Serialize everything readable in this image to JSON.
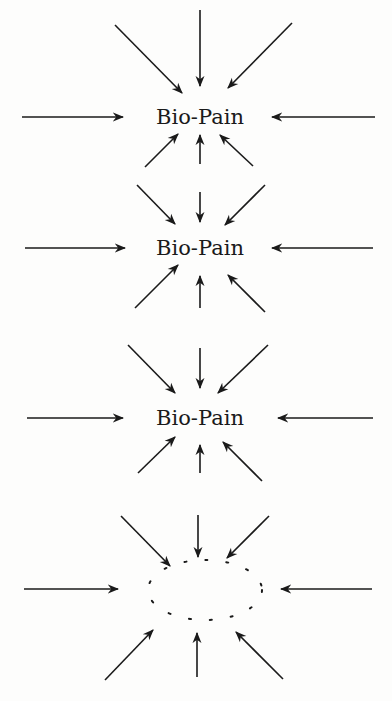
{
  "diagram": {
    "panels": [
      {
        "label": "Bio-Pain",
        "cx": 200,
        "cy": 117,
        "center": "text",
        "arrows": [
          [
            200,
            10,
            200,
            86
          ],
          [
            115,
            25,
            182,
            93
          ],
          [
            292,
            23,
            228,
            88
          ],
          [
            22,
            117,
            123,
            117
          ],
          [
            375,
            117,
            272,
            117
          ],
          [
            145,
            167,
            178,
            134
          ],
          [
            200,
            164,
            200,
            135
          ],
          [
            253,
            166,
            220,
            135
          ]
        ]
      },
      {
        "label": "Bio-Pain",
        "cx": 200,
        "cy": 248,
        "center": "text",
        "arrows": [
          [
            200,
            192,
            200,
            222
          ],
          [
            137,
            185,
            175,
            224
          ],
          [
            265,
            185,
            225,
            225
          ],
          [
            25,
            248,
            125,
            248
          ],
          [
            373,
            248,
            272,
            248
          ],
          [
            135,
            308,
            178,
            265
          ],
          [
            200,
            308,
            200,
            276
          ],
          [
            265,
            312,
            228,
            275
          ]
        ]
      },
      {
        "label": "Bio-Pain",
        "cx": 200,
        "cy": 418,
        "center": "text",
        "arrows": [
          [
            200,
            348,
            200,
            388
          ],
          [
            128,
            345,
            175,
            393
          ],
          [
            268,
            345,
            218,
            393
          ],
          [
            27,
            418,
            123,
            418
          ],
          [
            373,
            418,
            278,
            418
          ],
          [
            138,
            473,
            175,
            437
          ],
          [
            200,
            473,
            200,
            445
          ],
          [
            262,
            481,
            223,
            442
          ]
        ]
      },
      {
        "label": "",
        "cx": 205,
        "cy": 590,
        "center": "dotted-ellipse",
        "rx": 57,
        "ry": 30,
        "arrows": [
          [
            198,
            515,
            198,
            557
          ],
          [
            121,
            516,
            170,
            566
          ],
          [
            269,
            516,
            227,
            558
          ],
          [
            24,
            589,
            118,
            589
          ],
          [
            372,
            589,
            281,
            589
          ],
          [
            105,
            680,
            153,
            630
          ],
          [
            197,
            677,
            197,
            633
          ],
          [
            283,
            679,
            236,
            632
          ]
        ]
      }
    ],
    "colors": {
      "ink": "#1a1a1a",
      "background": "#fdfdfc"
    }
  }
}
